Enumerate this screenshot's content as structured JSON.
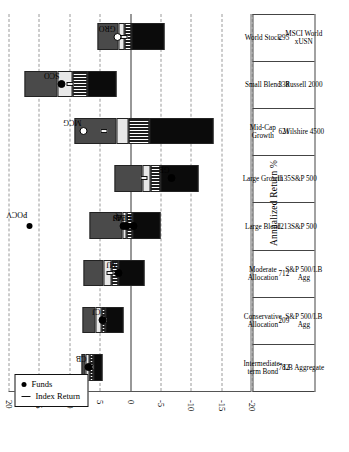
{
  "chart_data": {
    "type": "bar",
    "title": "",
    "xlabel": "",
    "ylabel": "Annualized Return %",
    "ylim": [
      -20,
      20
    ],
    "yticks": [
      20,
      15,
      10,
      5,
      0,
      -5,
      -10,
      -15,
      -20
    ],
    "ytick_labels": [
      "20",
      "15",
      "10",
      "5",
      "0",
      "-5",
      "-10",
      "-15",
      "-20"
    ],
    "grid": true,
    "legend_position": "top-left",
    "legend": [
      {
        "marker": "dot",
        "label": "Funds"
      },
      {
        "marker": "dash",
        "label": "Index Return"
      }
    ],
    "note": "Floating quartile-range bars: each bar spans the 5th-to-95th style distribution of category fund returns, split into four quartile segments (top quartile at the high end). A short line marks the index return; dots mark named funds.",
    "categories": [
      {
        "name": "Intermediate-term Bond",
        "count": "782",
        "index": "LB Aggregate",
        "q_top": 8.0,
        "q3": 7.3,
        "median": 6.6,
        "q1": 6.0,
        "q_bot": 4.6,
        "index_return": 6.7,
        "funds": [
          {
            "label": "CB",
            "value": 6.8,
            "hollow": false
          }
        ]
      },
      {
        "name": "Conservative Allocation",
        "count": "209",
        "index": "S&P 500/LB Agg",
        "q_top": 7.8,
        "q3": 5.6,
        "median": 4.7,
        "q1": 4.0,
        "q_bot": 1.1,
        "index_return": 4.6,
        "funds": [
          {
            "label": "CJ",
            "value": 4.6,
            "hollow": false
          }
        ]
      },
      {
        "name": "Moderate Allocation",
        "count": "712",
        "index": "S&P 500/LB Agg",
        "q_top": 7.6,
        "q3": 4.3,
        "median": 3.1,
        "q1": 1.9,
        "q_bot": -2.4,
        "index_return": 3.4,
        "funds": [
          {
            "label": "MJ",
            "value": 1.9,
            "hollow": false
          }
        ]
      },
      {
        "name": "Large Blend",
        "count": "1213",
        "index": "S&P 500",
        "q_top": 6.6,
        "q3": 1.3,
        "median": 0.6,
        "q1": -0.4,
        "q_bot": -5.1,
        "index_return": 0.9,
        "funds": [
          {
            "label": "AJ",
            "value": 1.1,
            "hollow": false
          },
          {
            "label": "MS",
            "value": 0.5,
            "hollow": false
          },
          {
            "label": "BEQ",
            "value": -0.6,
            "hollow": false
          }
        ]
      },
      {
        "name": "Large Growth",
        "count": "1135",
        "index": "S&P 500",
        "q_top": 2.6,
        "q3": -2.1,
        "median": -3.3,
        "q1": -5.1,
        "q_bot": -11.2,
        "index_return": -2.3,
        "funds": [
          {
            "label": "GE",
            "value": -6.9,
            "hollow": false
          }
        ]
      },
      {
        "name": "Mid-Cap Growth",
        "count": "621",
        "index": "Wilshire 4500",
        "q_top": 9.2,
        "q3": 2.2,
        "median": 0.2,
        "q1": -3.2,
        "q_bot": -13.8,
        "index_return": 4.4,
        "funds": [
          {
            "label": "MCG",
            "value": 7.7,
            "hollow": true
          }
        ]
      },
      {
        "name": "Small Blend",
        "count": "338",
        "index": "Russell 2000",
        "q_top": 17.3,
        "q3": 12.0,
        "median": 9.4,
        "q1": 7.0,
        "q_bot": 2.2,
        "index_return": 9.9,
        "funds": [
          {
            "label": "SCO",
            "value": 11.3,
            "hollow": false
          }
        ]
      },
      {
        "name": "World Stock",
        "count": "295",
        "index": "MSCI World xUSN",
        "q_top": 5.3,
        "q3": 1.9,
        "median": 0.9,
        "q1": -0.3,
        "q_bot": -5.7,
        "index_return": 1.1,
        "funds": [
          {
            "label": "GRO",
            "value": 2.1,
            "hollow": true
          }
        ]
      }
    ],
    "annotations": [
      {
        "label": "POCV",
        "marker": "dot",
        "x_category": "Large Blend",
        "value": 16.5
      }
    ],
    "table_rows": [
      "name",
      "count",
      "index"
    ]
  }
}
